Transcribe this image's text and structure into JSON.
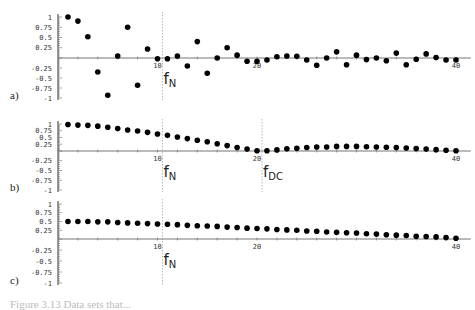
{
  "chart_data": [
    {
      "type": "scatter",
      "panel_label": "a)",
      "x": [
        1,
        2,
        3,
        4,
        5,
        6,
        7,
        8,
        9,
        10,
        11,
        12,
        13,
        14,
        15,
        16,
        17,
        18,
        19,
        20,
        21,
        22,
        23,
        24,
        25,
        26,
        27,
        28,
        29,
        30,
        31,
        32,
        33,
        34,
        35,
        36,
        37,
        38,
        39,
        40
      ],
      "values": [
        1.0,
        0.9,
        0.52,
        -0.35,
        -0.93,
        0.05,
        0.75,
        -0.68,
        0.22,
        -0.02,
        -0.02,
        0.05,
        -0.2,
        0.4,
        -0.38,
        0.0,
        0.25,
        0.07,
        -0.08,
        -0.08,
        -0.05,
        0.03,
        0.05,
        0.04,
        -0.05,
        -0.18,
        0.0,
        0.15,
        -0.17,
        0.07,
        -0.04,
        0.0,
        -0.07,
        0.12,
        -0.17,
        -0.03,
        0.1,
        0.01,
        -0.05,
        -0.05
      ],
      "xticks": [
        "10",
        "20",
        "40"
      ],
      "yticks": [
        "1",
        "0.75",
        "0.5",
        "0.25",
        "-0.25",
        "-0.5",
        "-0.75",
        "-1"
      ],
      "ylim": [
        -1,
        1
      ],
      "annotations": [
        {
          "text": "f",
          "sub": "N",
          "x": 10.5
        }
      ]
    },
    {
      "type": "scatter",
      "panel_label": "b)",
      "x": [
        1,
        2,
        3,
        4,
        5,
        6,
        7,
        8,
        9,
        10,
        11,
        12,
        13,
        14,
        15,
        16,
        17,
        18,
        19,
        20,
        21,
        22,
        23,
        24,
        25,
        26,
        27,
        28,
        29,
        30,
        31,
        32,
        33,
        34,
        35,
        36,
        37,
        38,
        39,
        40
      ],
      "values": [
        0.98,
        0.96,
        0.95,
        0.92,
        0.88,
        0.83,
        0.78,
        0.74,
        0.69,
        0.63,
        0.58,
        0.52,
        0.46,
        0.4,
        0.34,
        0.27,
        0.2,
        0.13,
        0.07,
        0.01,
        0.01,
        0.04,
        0.08,
        0.1,
        0.13,
        0.15,
        0.15,
        0.17,
        0.17,
        0.17,
        0.16,
        0.15,
        0.14,
        0.13,
        0.11,
        0.09,
        0.07,
        0.05,
        0.03,
        0.01
      ],
      "xticks": [
        "10",
        "20",
        "40"
      ],
      "yticks": [
        "1",
        "0.75",
        "0.5",
        "0.25",
        "-0.25",
        "-0.5",
        "-0.75",
        "-1"
      ],
      "ylim": [
        -1,
        1
      ],
      "annotations": [
        {
          "text": "f",
          "sub": "N",
          "x": 10.5
        },
        {
          "text": "f",
          "sub": "DC",
          "x": 20.5
        }
      ]
    },
    {
      "type": "scatter",
      "panel_label": "c)",
      "x": [
        1,
        2,
        3,
        4,
        5,
        6,
        7,
        8,
        9,
        10,
        11,
        12,
        13,
        14,
        15,
        16,
        17,
        18,
        19,
        20,
        21,
        22,
        23,
        24,
        25,
        26,
        27,
        28,
        29,
        30,
        31,
        32,
        33,
        34,
        35,
        36,
        37,
        38,
        39,
        40
      ],
      "values": [
        0.5,
        0.5,
        0.5,
        0.49,
        0.49,
        0.47,
        0.46,
        0.45,
        0.44,
        0.43,
        0.42,
        0.41,
        0.39,
        0.38,
        0.37,
        0.36,
        0.34,
        0.33,
        0.31,
        0.3,
        0.29,
        0.27,
        0.26,
        0.25,
        0.23,
        0.22,
        0.2,
        0.19,
        0.18,
        0.17,
        0.15,
        0.14,
        0.12,
        0.11,
        0.1,
        0.08,
        0.07,
        0.06,
        0.04,
        0.02
      ],
      "xticks": [
        "10",
        "20",
        "40"
      ],
      "yticks": [
        "1",
        "0.75",
        "0.5",
        "0.25",
        "-0.25",
        "-0.5",
        "-0.75",
        "-1"
      ],
      "ylim": [
        -1,
        1
      ],
      "annotations": [
        {
          "text": "f",
          "sub": "N",
          "x": 10.5
        }
      ]
    }
  ],
  "caption": "Figure 3.13  Data sets that..."
}
